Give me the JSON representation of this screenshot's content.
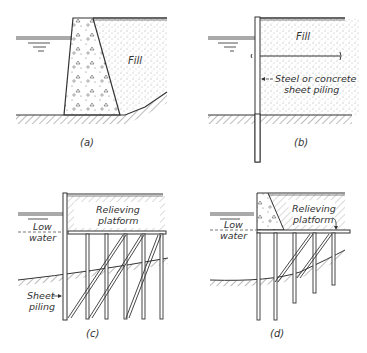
{
  "figure": {
    "panels": [
      {
        "id": "a",
        "caption": "(a)",
        "labels": {
          "fill": "Fill"
        }
      },
      {
        "id": "b",
        "caption": "(b)",
        "labels": {
          "fill": "Fill",
          "piling_line1": "Steel or concrete",
          "piling_line2": "sheet piling"
        }
      },
      {
        "id": "c",
        "caption": "(c)",
        "labels": {
          "platform_line1": "Relieving",
          "platform_line2": "platform",
          "water_line1": "Low",
          "water_line2": "water",
          "sheet_line1": "Sheet",
          "sheet_line2": "piling"
        }
      },
      {
        "id": "d",
        "caption": "(d)",
        "labels": {
          "platform_line1": "Relieving",
          "platform_line2": "platform",
          "water_line1": "Low",
          "water_line2": "water"
        }
      }
    ]
  },
  "colors": {
    "ink": "#333333",
    "background": "#ffffff"
  }
}
